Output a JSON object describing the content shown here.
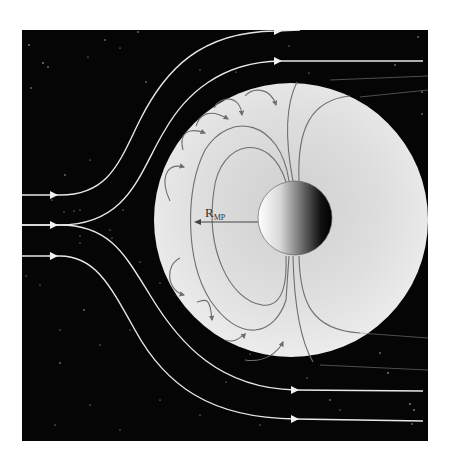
{
  "figure": {
    "label": {
      "main": "R",
      "subscript": "MP"
    },
    "colors": {
      "background": "#ffffff",
      "space": "#050505",
      "magnetosphere": "#e6e6e6",
      "field_lines": "#6e6e6e",
      "solar_wind_lines": "#e8e8e8",
      "planet_light": "#ffffff",
      "planet_dark": "#000000",
      "stars": "#d0d0d0"
    },
    "elements": {
      "solar_wind_streamlines": 4,
      "inflow_arrows": 3,
      "outflow_arrows": 4,
      "dipole_field_loops": 2,
      "open_field_lines": 4,
      "magnetopause_current_loops_top": 5,
      "magnetopause_current_loops_bottom": 4
    }
  }
}
